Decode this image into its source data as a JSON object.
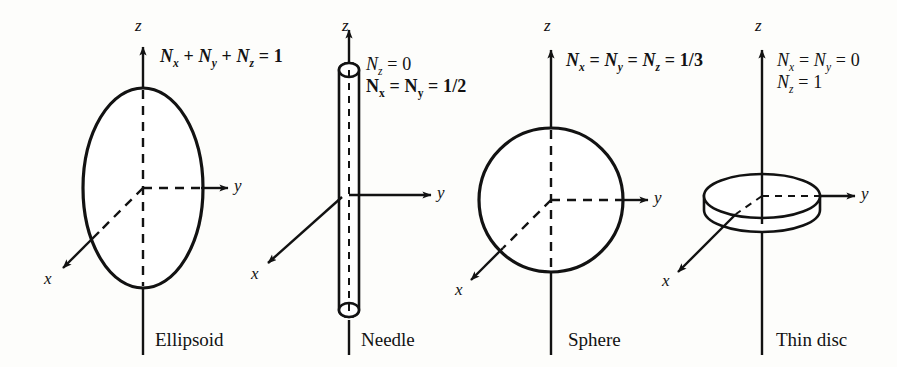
{
  "figure": {
    "background_color": "#fdfdfb",
    "ink_color": "#121212",
    "panels": [
      {
        "id": "ellipsoid",
        "caption": "Ellipsoid",
        "shape": "ellipsoid",
        "axes": {
          "z": "z",
          "y": "y",
          "x": "x"
        },
        "formula_lines": [
          {
            "html": "N<sub>x</sub> <span class=\"op\">+</span> N<sub>y</sub> <span class=\"op\">+</span> N<sub>z</sub> <span class=\"op\">=</span> <span class=\"num\">1</span>",
            "style": "italic-bold-result"
          }
        ],
        "formula_plain": [
          "Nx + Ny + Nz = 1"
        ]
      },
      {
        "id": "needle",
        "caption": "Needle",
        "shape": "needle",
        "axes": {
          "z": "z",
          "y": "y",
          "x": "x"
        },
        "formula_lines": [
          {
            "html": "N<sub>z</sub> <span class=\"op\">=</span> <span class=\"num\">0</span>",
            "style": "italic"
          },
          {
            "html": "N<sub>x</sub> <span class=\"op\">=</span> N<sub>y</sub> <span class=\"op\">=</span> <span class=\"num\">1/2</span>",
            "style": "upright"
          }
        ],
        "formula_plain": [
          "Nz = 0",
          "Nx = Ny = 1/2"
        ]
      },
      {
        "id": "sphere",
        "caption": "Sphere",
        "shape": "sphere",
        "axes": {
          "z": "z",
          "y": "y",
          "x": "x"
        },
        "formula_lines": [
          {
            "html": "N<sub>x</sub> <span class=\"op\">=</span> N<sub>y</sub> <span class=\"op\">=</span> N<sub>z</sub> <span class=\"op\">=</span> <span class=\"num\">1/3</span>",
            "style": "italic-bold-result"
          }
        ],
        "formula_plain": [
          "Nx = Ny = Nz = 1/3"
        ]
      },
      {
        "id": "thin-disc",
        "caption": "Thin disc",
        "shape": "disc",
        "axes": {
          "z": "z",
          "y": "y",
          "x": "x"
        },
        "formula_lines": [
          {
            "html": "N<sub>x</sub> <span class=\"op\">=</span> N<sub>y</sub> <span class=\"op\">=</span> <span class=\"num\">0</span>",
            "style": "italic"
          },
          {
            "html": "N<sub>z</sub> <span class=\"op\">=</span> <span class=\"num\">1</span>",
            "style": "italic"
          }
        ],
        "formula_plain": [
          "Nx = Ny = 0",
          "Nz = 1"
        ]
      }
    ]
  }
}
